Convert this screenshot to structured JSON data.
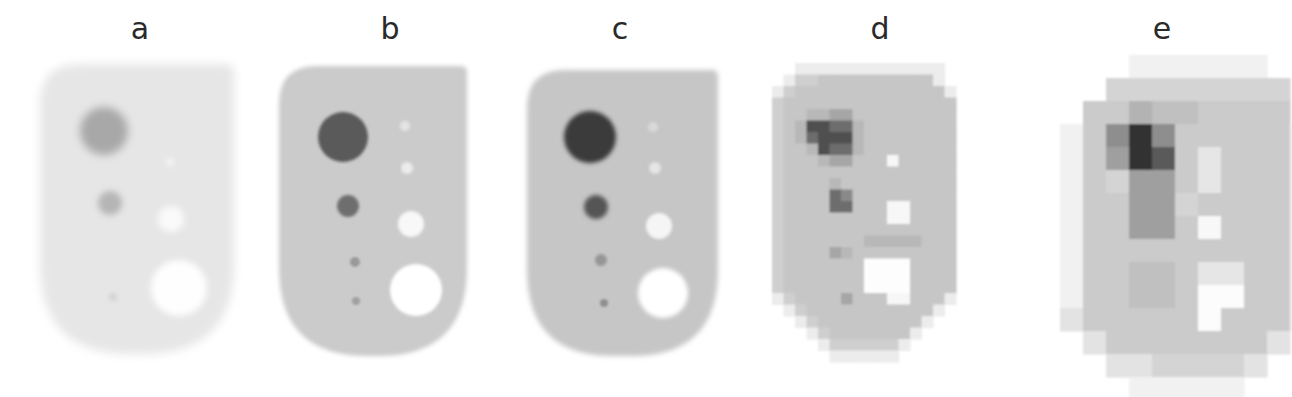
{
  "figure": {
    "background": "#ffffff",
    "label_color": "#2a2a2a",
    "panels": [
      {
        "id": "a",
        "label": "a",
        "label_x": 140,
        "kind": "smooth",
        "description": "noisy low-count phantom image",
        "body": {
          "x": 40,
          "y": 64,
          "w": 194,
          "h": 290,
          "top_left_r": 40,
          "top_right_r": 8,
          "bottom_r": 90,
          "fill": "#e6e6e6",
          "blur": 5
        },
        "spots": [
          {
            "type": "hot",
            "cx": 104,
            "cy": 131,
            "r": 24,
            "fill": "#a8a8a8",
            "blur": 4
          },
          {
            "type": "hot",
            "cx": 110,
            "cy": 203,
            "r": 12,
            "fill": "#b5b5b5",
            "blur": 3
          },
          {
            "type": "hot",
            "cx": 113,
            "cy": 297,
            "r": 4,
            "fill": "#d2d2d2",
            "blur": 2
          },
          {
            "type": "cold",
            "cx": 171,
            "cy": 219,
            "r": 13,
            "fill": "#fafafa",
            "blur": 3
          },
          {
            "type": "cold",
            "cx": 179,
            "cy": 288,
            "r": 28,
            "fill": "#fefefe",
            "blur": 3
          },
          {
            "type": "cold",
            "cx": 170,
            "cy": 162,
            "r": 5,
            "fill": "#f0f0f0",
            "blur": 2
          }
        ]
      },
      {
        "id": "b",
        "label": "b",
        "label_x": 390,
        "kind": "smooth",
        "description": "high-count phantom image",
        "body": {
          "x": 279,
          "y": 66,
          "w": 188,
          "h": 290,
          "top_left_r": 38,
          "top_right_r": 6,
          "bottom_r": 88,
          "fill": "#cbcbcb",
          "blur": 2
        },
        "spots": [
          {
            "type": "hot",
            "cx": 343,
            "cy": 137,
            "r": 25,
            "fill": "#5a5a5a",
            "blur": 1.5
          },
          {
            "type": "hot",
            "cx": 348,
            "cy": 206,
            "r": 11,
            "fill": "#6e6e6e",
            "blur": 1.5
          },
          {
            "type": "hot",
            "cx": 355,
            "cy": 262,
            "r": 5,
            "fill": "#9a9a9a",
            "blur": 1.2
          },
          {
            "type": "hot",
            "cx": 356,
            "cy": 301,
            "r": 4,
            "fill": "#a0a0a0",
            "blur": 1.2
          },
          {
            "type": "cold",
            "cx": 405,
            "cy": 126,
            "r": 5,
            "fill": "#e4e4e4",
            "blur": 1.5
          },
          {
            "type": "cold",
            "cx": 407,
            "cy": 168,
            "r": 6,
            "fill": "#ececec",
            "blur": 1.5
          },
          {
            "type": "cold",
            "cx": 411,
            "cy": 224,
            "r": 13,
            "fill": "#f8f8f8",
            "blur": 1.5
          },
          {
            "type": "cold",
            "cx": 416,
            "cy": 290,
            "r": 26,
            "fill": "#ffffff",
            "blur": 1.5
          }
        ]
      },
      {
        "id": "c",
        "label": "c",
        "label_x": 620,
        "kind": "smooth",
        "description": "reconstructed image, fine voxel size",
        "body": {
          "x": 527,
          "y": 70,
          "w": 191,
          "h": 286,
          "top_left_r": 38,
          "top_right_r": 6,
          "bottom_r": 86,
          "fill": "#c6c6c6",
          "blur": 2.5
        },
        "spots": [
          {
            "type": "hot",
            "cx": 590,
            "cy": 137,
            "r": 26,
            "fill": "#3a3a3a",
            "blur": 2
          },
          {
            "type": "hot",
            "cx": 596,
            "cy": 207,
            "r": 12,
            "fill": "#555555",
            "blur": 2
          },
          {
            "type": "hot",
            "cx": 601,
            "cy": 260,
            "r": 6,
            "fill": "#959595",
            "blur": 1.5
          },
          {
            "type": "hot",
            "cx": 604,
            "cy": 303,
            "r": 4,
            "fill": "#8f8f8f",
            "blur": 1.2
          },
          {
            "type": "cold",
            "cx": 653,
            "cy": 127,
            "r": 5,
            "fill": "#d9d9d9",
            "blur": 1.5
          },
          {
            "type": "cold",
            "cx": 655,
            "cy": 168,
            "r": 6,
            "fill": "#e5e5e5",
            "blur": 1.5
          },
          {
            "type": "cold",
            "cx": 659,
            "cy": 226,
            "r": 13,
            "fill": "#f5f5f5",
            "blur": 1.5
          },
          {
            "type": "cold",
            "cx": 663,
            "cy": 293,
            "r": 25,
            "fill": "#ffffff",
            "blur": 2
          }
        ]
      },
      {
        "id": "d",
        "label": "d",
        "label_x": 880,
        "kind": "grid",
        "description": "reconstructed image, coarse voxel size (~11.5 px cells)",
        "grid": {
          "x0": 772,
          "y0": 63,
          "cell": 11.5,
          "blur": 0.8,
          "levels": {
            "0": null,
            "1": "#ececec",
            "2": "#dedede",
            "3": "#cfcfcf",
            "4": "#c6c6c6",
            "5": "#b8b8b8",
            "6": "#a6a6a6",
            "7": "#8a8a8a",
            "8": "#6d6d6d",
            "9": "#505050",
            "W": "#f7f7f7",
            "X": "#fdfdfd"
          },
          "rows": [
            "0011111111111110",
            "0133444444444410",
            "1344444444444441",
            "3444444444444444",
            "3445566444444444",
            "3459988544444444",
            "3458999544444444",
            "3445988544444444",
            "3444566444W44444",
            "3444444444444444",
            "3444454444444444",
            "3444487444444444",
            "3444488444WW4444",
            "3444444444WW4444",
            "3444444444444444",
            "3444444455555444",
            "3444465444444444",
            "34444444XXXX4444",
            "34444444XXXX4444",
            "34444444XXXX4444",
            "1344446444WW4441",
            "0134444444444410",
            "0013444444444100",
            "0001344444441000",
            "0000133333310000",
            "0000011111100000"
          ]
        }
      },
      {
        "id": "e",
        "label": "e",
        "label_x": 1162,
        "kind": "grid",
        "description": "reconstructed image, very coarse voxel size (~23 px cells)",
        "grid": {
          "x0": 1037,
          "y0": 55,
          "cell": 23,
          "blur": 0.8,
          "levels": {
            "0": null,
            "1": "#f1f1f1",
            "2": "#e3e3e3",
            "3": "#d4d4d4",
            "4": "#cbcbcb",
            "5": "#c0c0c0",
            "6": "#b3b3b3",
            "7": "#9f9f9f",
            "8": "#8e8e8e",
            "9": "#5a5a5a",
            "K": "#303030",
            "W": "#f8f8f8",
            "X": "#fcfcfc",
            "L": "#e6e6e6"
          },
          "rows": [
            "0000111111000",
            "0003333333300",
            "0044655444400",
            "0148K84444410",
            "0147K94L44410",
            "0143774L44410",
            "0144773444410",
            "0144774W44410",
            "0144444444410",
            "0144554LL4410",
            "0144554XX4410",
            "0244444X44410",
            "0024444444200",
            "0002233332000",
            "0000111110000"
          ]
        }
      }
    ]
  }
}
